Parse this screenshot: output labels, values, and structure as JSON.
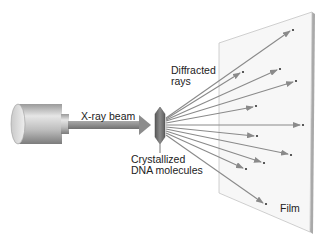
{
  "diagram": {
    "labels": {
      "beam": "X-ray beam",
      "diffracted_line1": "Diffracted",
      "diffracted_line2": "rays",
      "crystal_line1": "Crystallized",
      "crystal_line2": "DNA molecules",
      "film": "Film"
    },
    "components": [
      "x-ray-source",
      "x-ray-beam",
      "dna-crystal",
      "diffracted-rays",
      "film"
    ],
    "colors": {
      "ray": "#8a8a8a",
      "beam": "#8c8c8c",
      "crystal": "#6e6e6e",
      "film": "#f7f7f7",
      "film_edge": "#a9a9a9",
      "source": "#c8c8c8"
    },
    "ray_count": 11
  }
}
